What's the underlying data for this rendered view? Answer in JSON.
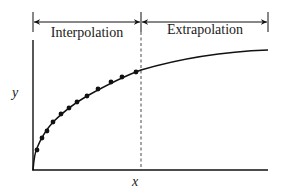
{
  "diagram": {
    "type": "interpolation-vs-extrapolation",
    "regions": [
      {
        "label": "Interpolation",
        "x_start": 33,
        "x_end": 141
      },
      {
        "label": "Extrapolation",
        "x_start": 141,
        "x_end": 268
      }
    ],
    "axes": {
      "xlabel": "x",
      "ylabel": "y"
    },
    "boundary": {
      "style": "dashed",
      "x": 141
    },
    "curve": {
      "description": "concave increasing saturating curve",
      "path": "M33,170 C34,158 35,152 37,148 C41,138 46,130 53,122 C63,112 75,103 87,96 C105,86 122,77 141,70 C175,60 215,52 268,50"
    },
    "data_points": [
      [
        37,
        150
      ],
      [
        42,
        138
      ],
      [
        47,
        131
      ],
      [
        53,
        122
      ],
      [
        61,
        114
      ],
      [
        69,
        108
      ],
      [
        77,
        102
      ],
      [
        87,
        96
      ],
      [
        98,
        89
      ],
      [
        111,
        82
      ],
      [
        122,
        77
      ],
      [
        136,
        72
      ]
    ],
    "colors": {
      "stroke": "#111111",
      "background": "#ffffff"
    }
  }
}
